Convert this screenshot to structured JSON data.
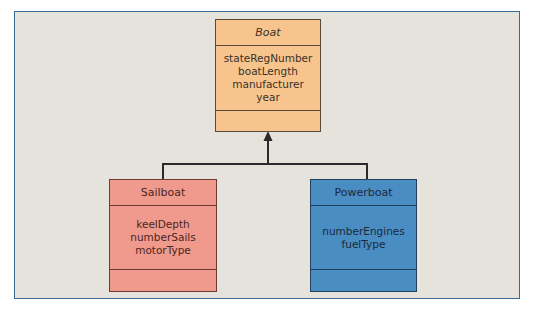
{
  "diagram": {
    "type": "uml-class-inheritance",
    "colors": {
      "background": "#e6e3dc",
      "frame_border": "#3a6a96",
      "boat_fill": "#f7c48d",
      "sailboat_fill": "#f09a8e",
      "powerboat_fill": "#4a8dc3"
    },
    "classes": {
      "boat": {
        "name": "Boat",
        "abstract": true,
        "attributes": [
          "stateRegNumber",
          "boatLength",
          "manufacturer",
          "year"
        ]
      },
      "sailboat": {
        "name": "Sailboat",
        "attributes": [
          "keelDepth",
          "numberSails",
          "motorType"
        ]
      },
      "powerboat": {
        "name": "Powerboat",
        "attributes": [
          "numberEngines",
          "fuelType"
        ]
      }
    },
    "relationships": [
      {
        "from": "Sailboat",
        "to": "Boat",
        "type": "generalization"
      },
      {
        "from": "Powerboat",
        "to": "Boat",
        "type": "generalization"
      }
    ]
  }
}
